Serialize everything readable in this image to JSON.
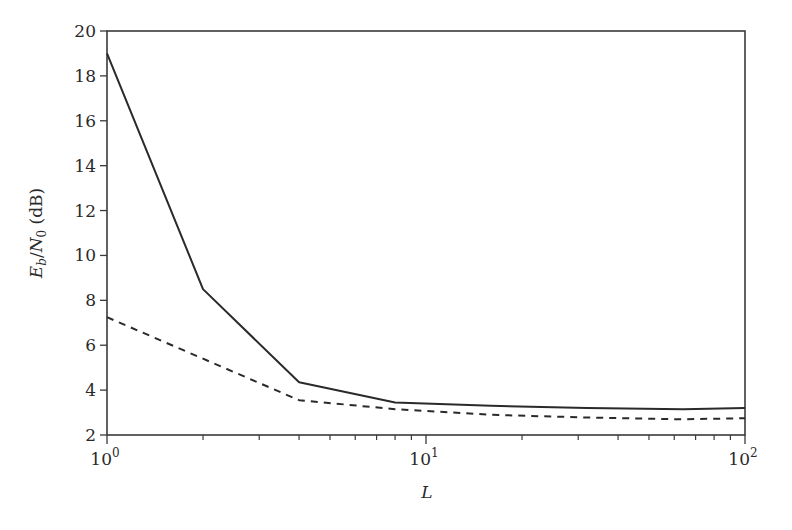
{
  "chart_data": {
    "type": "line",
    "title": "",
    "xlabel": "L",
    "ylabel": "E_b/N_0 (dB)",
    "ylabel_parts": {
      "E": "E",
      "b": "b",
      "slash": "/",
      "N": "N",
      "zero": "0",
      "unit": " (dB)"
    },
    "xscale": "log",
    "xlim": [
      1,
      100
    ],
    "ylim": [
      2,
      20
    ],
    "grid": false,
    "legend": null,
    "x_ticks": [
      {
        "value": 1,
        "base": "10",
        "exp": "0"
      },
      {
        "value": 10,
        "base": "10",
        "exp": "1"
      },
      {
        "value": 100,
        "base": "10",
        "exp": "2"
      }
    ],
    "y_ticks": [
      2,
      4,
      6,
      8,
      10,
      12,
      14,
      16,
      18,
      20
    ],
    "series": [
      {
        "name": "solid",
        "style": "solid",
        "x": [
          1,
          2,
          4,
          8,
          16,
          32,
          64,
          100
        ],
        "values": [
          19.0,
          8.5,
          4.35,
          3.45,
          3.3,
          3.2,
          3.15,
          3.2
        ]
      },
      {
        "name": "dashed",
        "style": "dashed",
        "x": [
          1,
          2,
          4,
          8,
          16,
          32,
          64,
          100
        ],
        "values": [
          7.25,
          5.4,
          3.55,
          3.15,
          2.9,
          2.78,
          2.7,
          2.75
        ]
      }
    ]
  },
  "colors": {
    "line": "#2a2a2a",
    "axis": "#3a3a3a",
    "background": "#ffffff"
  }
}
